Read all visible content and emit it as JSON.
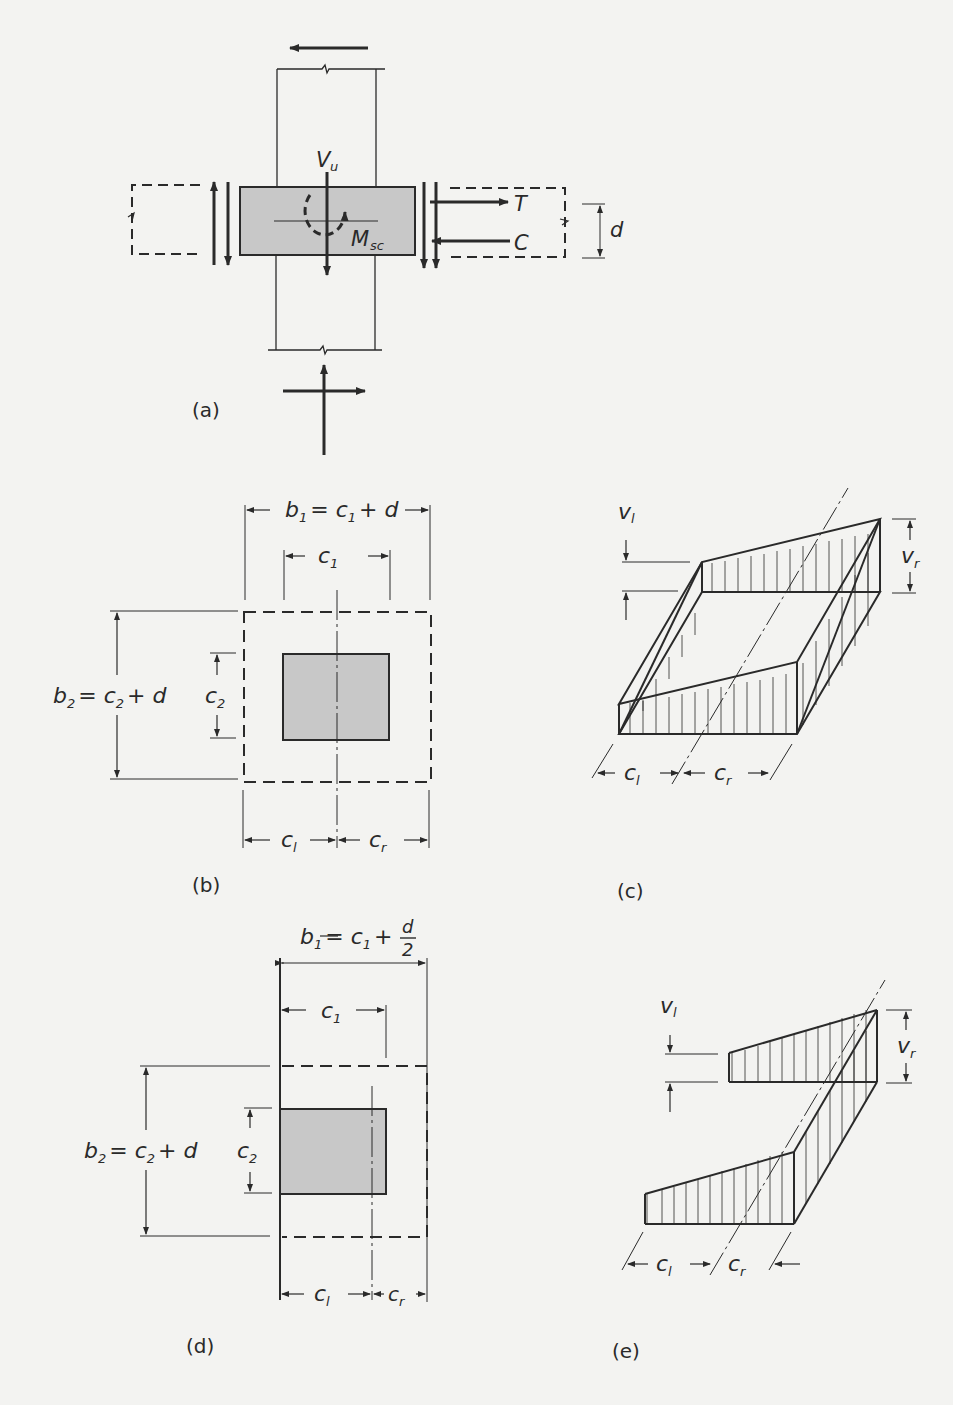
{
  "figure": {
    "panels": [
      {
        "id": "a",
        "caption": "(a)",
        "labels": {
          "shear": "V",
          "shear_sub": "u",
          "moment": "M",
          "moment_sub": "sc",
          "tension": "T",
          "compression": "C",
          "depth": "d"
        }
      },
      {
        "id": "b",
        "caption": "(b)",
        "labels": {
          "b1_lhs": "b",
          "b1_sub": "1",
          "b1_rhs": "= c",
          "b1_rhs_sub": "1",
          "b1_tail": "+ d",
          "c1": "c",
          "c1_sub": "1",
          "b2_lhs": "b",
          "b2_sub": "2",
          "b2_rhs": "= c",
          "b2_rhs_sub": "2",
          "b2_tail": "+ d",
          "c2": "c",
          "c2_sub": "2",
          "cl": "c",
          "cl_sub": "l",
          "cr": "c",
          "cr_sub": "r"
        }
      },
      {
        "id": "c",
        "caption": "(c)",
        "labels": {
          "vl": "v",
          "vl_sub": "l",
          "vr": "v",
          "vr_sub": "r",
          "cl": "c",
          "cl_sub": "l",
          "cr": "c",
          "cr_sub": "r"
        }
      },
      {
        "id": "d",
        "caption": "(d)",
        "labels": {
          "b1_lhs": "b",
          "b1_sub": "1",
          "b1_rhs": "= c",
          "b1_rhs_sub": "1",
          "b1_tail": "+",
          "frac_num": "d",
          "frac_den": "2",
          "c1": "c",
          "c1_sub": "1",
          "b2_lhs": "b",
          "b2_sub": "2",
          "b2_rhs": "= c",
          "b2_rhs_sub": "2",
          "b2_tail": "+ d",
          "c2": "c",
          "c2_sub": "2",
          "cl": "c",
          "cl_sub": "l",
          "cr": "c",
          "cr_sub": "r"
        }
      },
      {
        "id": "e",
        "caption": "(e)",
        "labels": {
          "vl": "v",
          "vl_sub": "l",
          "vr": "v",
          "vr_sub": "r",
          "cl": "c",
          "cl_sub": "l",
          "cr": "c",
          "cr_sub": "r"
        }
      }
    ],
    "colors": {
      "ink": "#2a2a2a",
      "column_fill": "#c8c8c8",
      "background": "#f3f3f1"
    }
  }
}
